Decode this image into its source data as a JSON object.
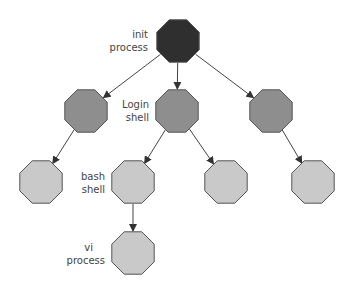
{
  "diagram": {
    "type": "process-tree",
    "colors": {
      "root": "#2f2f2f",
      "level2": "#8e8e8e",
      "level3": "#c9c9c9",
      "stroke": "#555555",
      "edge": "#444444"
    },
    "nodes": [
      {
        "id": "init",
        "cx": 178,
        "cy": 41,
        "level": "root",
        "label": [
          "init",
          "process"
        ]
      },
      {
        "id": "l2a",
        "cx": 86,
        "cy": 111,
        "level": "level2"
      },
      {
        "id": "login",
        "cx": 177,
        "cy": 111,
        "level": "level2",
        "label": [
          "Login",
          "shell"
        ]
      },
      {
        "id": "l2c",
        "cx": 271,
        "cy": 111,
        "level": "level2"
      },
      {
        "id": "l3a",
        "cx": 41,
        "cy": 182,
        "level": "level3"
      },
      {
        "id": "bash",
        "cx": 133,
        "cy": 182,
        "level": "level3",
        "label": [
          "bash",
          "shell"
        ]
      },
      {
        "id": "l3c",
        "cx": 226,
        "cy": 182,
        "level": "level3"
      },
      {
        "id": "l3d",
        "cx": 313,
        "cy": 182,
        "level": "level3"
      },
      {
        "id": "vi",
        "cx": 133,
        "cy": 253,
        "level": "level3",
        "label": [
          "vi",
          "process"
        ]
      }
    ],
    "edges": [
      [
        "init",
        "l2a"
      ],
      [
        "init",
        "login"
      ],
      [
        "init",
        "l2c"
      ],
      [
        "l2a",
        "l3a"
      ],
      [
        "login",
        "bash"
      ],
      [
        "login",
        "l3c"
      ],
      [
        "l2c",
        "l3d"
      ],
      [
        "bash",
        "vi"
      ]
    ]
  },
  "labels": {
    "init": {
      "line1": "init",
      "line2": "process"
    },
    "login": {
      "line1": "Login",
      "line2": "shell"
    },
    "bash": {
      "line1": "bash",
      "line2": "shell"
    },
    "vi": {
      "line1": "vi",
      "line2": "process"
    }
  }
}
